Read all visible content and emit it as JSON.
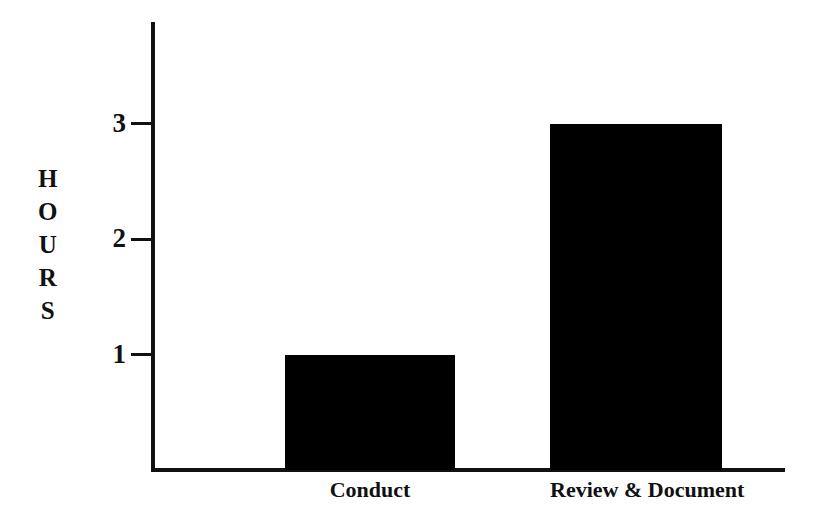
{
  "chart_data": {
    "type": "bar",
    "title": "",
    "xlabel": "",
    "ylabel": "HOURS",
    "categories": [
      "Conduct",
      "Review & Document"
    ],
    "values": [
      1,
      3
    ],
    "yticks": [
      1,
      2,
      3
    ],
    "ytick_labels": [
      "1",
      "2",
      "3"
    ],
    "ylim": [
      0,
      3.88
    ],
    "grid": false,
    "legend": null,
    "bar_color": "#000000",
    "axis_color": "#000000",
    "background_color": "#ffffff",
    "series": [
      {
        "name": "Hours",
        "values": [
          1,
          3
        ]
      }
    ]
  },
  "axis": {
    "y_title_letters": [
      "H",
      "O",
      "U",
      "R",
      "S"
    ]
  }
}
